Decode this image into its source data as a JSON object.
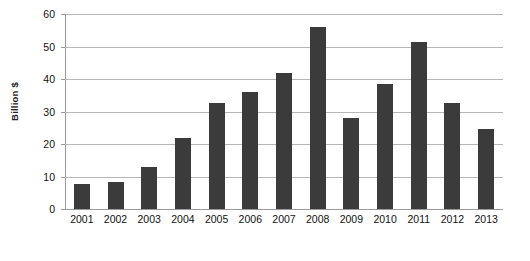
{
  "chart_data": {
    "type": "bar",
    "title": "",
    "subtitle": "",
    "xlabel": "",
    "ylabel": "Billion $",
    "categories": [
      "2001",
      "2002",
      "2003",
      "2004",
      "2005",
      "2006",
      "2007",
      "2008",
      "2009",
      "2010",
      "2011",
      "2012",
      "2013"
    ],
    "values": [
      7.6,
      8.3,
      13.0,
      21.7,
      32.7,
      36.1,
      42.0,
      56.1,
      27.9,
      38.5,
      51.5,
      32.5,
      24.6
    ],
    "ylim": [
      0,
      60
    ],
    "yticks": [
      0,
      10,
      20,
      30,
      40,
      50,
      60
    ],
    "ytick_labels": [
      "0",
      "10",
      "20",
      "30",
      "40",
      "50",
      "60"
    ],
    "grid": true,
    "grid_axis": "y",
    "legend": false,
    "legend_position": "none",
    "bar_color": "#3b3b3b",
    "gridline_color": "#b6b6b6",
    "axis_color": "#9a9a9a",
    "background_color": "#ffffff"
  }
}
